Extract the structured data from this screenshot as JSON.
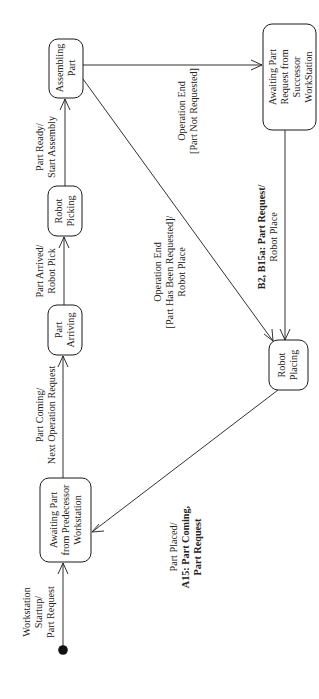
{
  "diagram": {
    "type": "uml-state-machine",
    "orientation": "rotated-90-ccw",
    "colors": {
      "line": "#1a1a1a",
      "text": "#222222",
      "background": "#ffffff"
    },
    "initial_state": {
      "id": "initial",
      "label": ""
    },
    "states": [
      {
        "id": "awaiting-predecessor",
        "lines": [
          "Awaiting Part",
          "from Predecessor",
          "Workstation"
        ]
      },
      {
        "id": "part-arriving",
        "lines": [
          "Part",
          "Arriving"
        ]
      },
      {
        "id": "robot-picking",
        "lines": [
          "Robot",
          "Picking"
        ]
      },
      {
        "id": "assembling-part",
        "lines": [
          "Assembling",
          "Part"
        ]
      },
      {
        "id": "awaiting-successor",
        "lines": [
          "Awaiting Part",
          "Request from",
          "Successor",
          "WorkStation"
        ]
      },
      {
        "id": "robot-placing",
        "lines": [
          "Robot",
          "Placing"
        ]
      }
    ],
    "transitions": [
      {
        "id": "t-startup",
        "from": "initial",
        "to": "awaiting-predecessor",
        "lines": [
          {
            "text": "Workstation",
            "bold": false
          },
          {
            "text": "Startup/",
            "bold": false
          },
          {
            "text": "Part Request",
            "bold": false
          }
        ]
      },
      {
        "id": "t-part-coming",
        "from": "awaiting-predecessor",
        "to": "part-arriving",
        "lines": [
          {
            "text": "Part Coming/",
            "bold": false
          },
          {
            "text": "Next Operation Request",
            "bold": false
          }
        ]
      },
      {
        "id": "t-part-arrived",
        "from": "part-arriving",
        "to": "robot-picking",
        "lines": [
          {
            "text": "Part Arrived/",
            "bold": false
          },
          {
            "text": "Robot Pick",
            "bold": false
          }
        ]
      },
      {
        "id": "t-part-ready",
        "from": "robot-picking",
        "to": "assembling-part",
        "lines": [
          {
            "text": "Part Ready/",
            "bold": false
          },
          {
            "text": "Start Assembly",
            "bold": false
          }
        ]
      },
      {
        "id": "t-op-end-not-requested",
        "from": "assembling-part",
        "to": "awaiting-successor",
        "lines": [
          {
            "text": "Operation End",
            "bold": false
          },
          {
            "text": "[Part Not Requested]",
            "bold": false
          }
        ]
      },
      {
        "id": "t-op-end-requested",
        "from": "assembling-part",
        "to": "robot-placing",
        "lines": [
          {
            "text": "Operation End",
            "bold": false
          },
          {
            "text": "[Part Has Been Requested]/",
            "bold": false
          },
          {
            "text": "Robot Place",
            "bold": false
          }
        ]
      },
      {
        "id": "t-part-request",
        "from": "awaiting-successor",
        "to": "robot-placing",
        "lines": [
          {
            "text": "B2, B15a: Part Request/",
            "bold": true
          },
          {
            "text": "Robot Place",
            "bold": false
          }
        ]
      },
      {
        "id": "t-part-placed",
        "from": "robot-placing",
        "to": "awaiting-predecessor",
        "lines": [
          {
            "text": "Part Placed/",
            "bold": false
          },
          {
            "text": "A15: Part Coming,",
            "bold": true
          },
          {
            "text": "Part Request",
            "bold": true
          }
        ]
      }
    ]
  }
}
